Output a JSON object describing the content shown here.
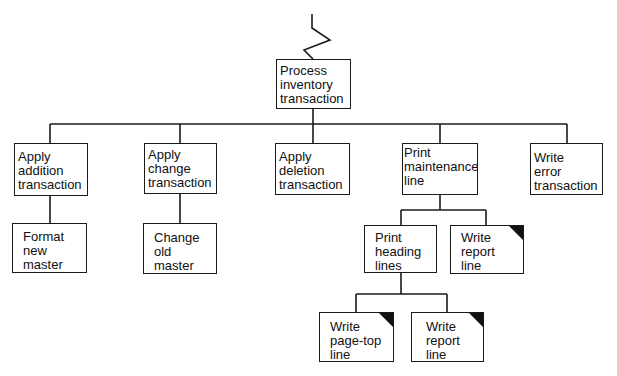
{
  "diagram": {
    "type": "structure-chart",
    "root": {
      "id": "process",
      "lines": [
        "Process",
        "inventory",
        "transaction"
      ]
    },
    "level1": [
      {
        "id": "add",
        "lines": [
          "Apply",
          "addition",
          "transaction"
        ]
      },
      {
        "id": "change",
        "lines": [
          "Apply",
          "change",
          "transaction"
        ]
      },
      {
        "id": "delete",
        "lines": [
          "Apply",
          "deletion",
          "transaction"
        ]
      },
      {
        "id": "printmaint",
        "lines": [
          "Print",
          "maintenance",
          "line"
        ]
      },
      {
        "id": "writeerr",
        "lines": [
          "Write",
          "error",
          "transaction"
        ]
      }
    ],
    "level2": [
      {
        "id": "format",
        "parent": "add",
        "lines": [
          "Format",
          "new",
          "master"
        ]
      },
      {
        "id": "changeold",
        "parent": "change",
        "lines": [
          "Change",
          "old",
          "master"
        ]
      },
      {
        "id": "printhead",
        "parent": "printmaint",
        "lines": [
          "Print",
          "heading",
          "lines"
        ]
      },
      {
        "id": "writereport1",
        "parent": "printmaint",
        "lines": [
          "Write",
          "report",
          "line"
        ],
        "common_module": true
      }
    ],
    "level3": [
      {
        "id": "pagetop",
        "parent": "printhead",
        "lines": [
          "Write",
          "page-top",
          "line"
        ],
        "common_module": true
      },
      {
        "id": "writereport2",
        "parent": "printhead",
        "lines": [
          "Write",
          "report",
          "line"
        ],
        "common_module": true
      }
    ],
    "colors": {
      "line": "#1a1a1a",
      "background": "#ffffff",
      "corner_marker": "#111111"
    }
  }
}
